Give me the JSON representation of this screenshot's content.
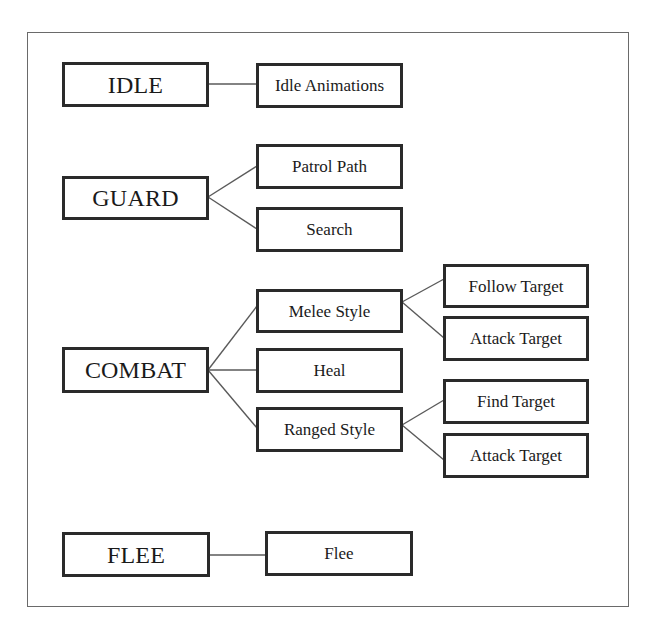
{
  "diagram": {
    "type": "state-behavior-tree",
    "states": [
      {
        "id": "idle",
        "label": "IDLE",
        "children": [
          {
            "id": "idle-animations",
            "label": "Idle Animations",
            "children": []
          }
        ]
      },
      {
        "id": "guard",
        "label": "GUARD",
        "children": [
          {
            "id": "patrol-path",
            "label": "Patrol Path",
            "children": []
          },
          {
            "id": "search",
            "label": "Search",
            "children": []
          }
        ]
      },
      {
        "id": "combat",
        "label": "COMBAT",
        "children": [
          {
            "id": "melee-style",
            "label": "Melee Style",
            "children": [
              {
                "id": "follow-target",
                "label": "Follow Target"
              },
              {
                "id": "melee-attack-target",
                "label": "Attack Target"
              }
            ]
          },
          {
            "id": "heal",
            "label": "Heal",
            "children": []
          },
          {
            "id": "ranged-style",
            "label": "Ranged Style",
            "children": [
              {
                "id": "find-target",
                "label": "Find Target"
              },
              {
                "id": "ranged-attack-target",
                "label": "Attack Target"
              }
            ]
          }
        ]
      },
      {
        "id": "flee",
        "label": "FLEE",
        "children": [
          {
            "id": "flee-action",
            "label": "Flee",
            "children": []
          }
        ]
      }
    ],
    "colors": {
      "box_border": "#2a2a2a",
      "line": "#5a5a5a",
      "frame": "#6a6a6a",
      "background": "#ffffff"
    }
  }
}
